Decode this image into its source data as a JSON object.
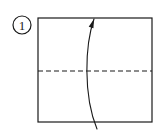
{
  "figure": {
    "background_color": "#ffffff",
    "ink_color": "#1a1a1a",
    "canvas": {
      "width": 164,
      "height": 133
    }
  },
  "step_badge": {
    "label": "1",
    "shape": "circle",
    "center_x": 22,
    "center_y": 25,
    "radius": 9,
    "stroke_color": "#1a1a1a"
  },
  "paper": {
    "name": "square-sheet",
    "shape": "square",
    "left": 38,
    "top": 18,
    "right": 152,
    "bottom": 122,
    "stroke_color": "#1a1a1a",
    "fill_color": "#ffffff",
    "stroke_width": 1.2
  },
  "fold_line": {
    "name": "horizontal-valley-crease",
    "style": "dashed",
    "orientation": "horizontal",
    "x_start": 38,
    "x_end": 152,
    "y": 71,
    "dash_length": 5,
    "gap_length": 3,
    "stroke_color": "#1a1a1a",
    "stroke_width": 1.1
  },
  "fold_arrow": {
    "name": "fold-direction-arrow",
    "direction": "up",
    "start_x": 97,
    "start_y": 129,
    "control1_x": 83,
    "control1_y": 95,
    "control2_x": 85,
    "control2_y": 45,
    "end_x": 94,
    "end_y": 19,
    "head_angle_deg": 18,
    "head_length": 9,
    "head_width": 5,
    "stroke_color": "#1a1a1a",
    "stroke_width": 1.1
  },
  "legend": {
    "dashed_line_meaning": "valley fold crease",
    "arrow_meaning": "fold bottom edge up to top edge"
  }
}
